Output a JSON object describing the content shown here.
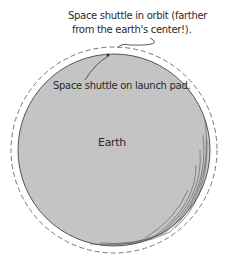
{
  "diagram": {
    "orbit_label_line1": "Space shuttle in orbit (farther",
    "orbit_label_line2": "from the earth's center!).",
    "launch_label": "Space shuttle on launch pad.",
    "earth_label": "Earth",
    "colors": {
      "earth_fill": "#c4c4c4",
      "earth_outline": "#555555",
      "orbit_dash": "#777777",
      "text": "#2a2a2a"
    }
  }
}
